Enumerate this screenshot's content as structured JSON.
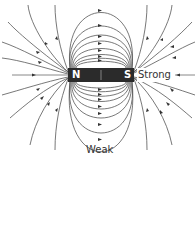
{
  "diagram": {
    "magnet": {
      "north_label": "N",
      "south_label": "S",
      "body_color": "#2b2b2b",
      "label_color": "#ffffff"
    },
    "labels": {
      "strong": "Strong",
      "weak": "Weak"
    },
    "colors": {
      "field_line": "#555555",
      "axis_line": "#888888",
      "text": "#333333"
    }
  }
}
